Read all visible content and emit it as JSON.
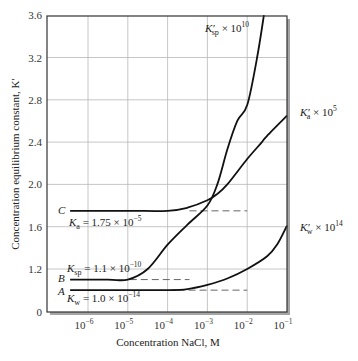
{
  "chart_data": {
    "type": "line",
    "title": "",
    "xlabel": "Concentration NaCl, M",
    "ylabel": "Concentration equilibrium constant, K′",
    "xscale": "log",
    "xlim_log10": [
      -6.5,
      -1
    ],
    "ylim": [
      0,
      3.6
    ],
    "y_axis_break": "axis broken between 0 and 1.2",
    "grid": true,
    "x_ticks": [
      {
        "log": -6,
        "label": "10",
        "exp": "−6"
      },
      {
        "log": -5,
        "label": "10",
        "exp": "−5"
      },
      {
        "log": -4,
        "label": "10",
        "exp": "−4"
      },
      {
        "log": -3,
        "label": "10",
        "exp": "−3"
      },
      {
        "log": -2,
        "label": "10",
        "exp": "−2"
      },
      {
        "log": -1,
        "label": "10",
        "exp": "−1"
      }
    ],
    "y_ticks": [
      "0",
      "1.2",
      "1.6",
      "2.0",
      "2.4",
      "2.8",
      "3.2",
      "3.6"
    ],
    "series": [
      {
        "name": "K′sp × 10^10",
        "letter": "B",
        "thermo_label": "Ksp = 1.1 × 10^−10",
        "x_log10": [
          -6.45,
          -5.5,
          -5.0,
          -4.5,
          -4.0,
          -3.5,
          -3.0,
          -2.75,
          -2.5,
          -2.25,
          -2.0,
          -1.75,
          -1.58
        ],
        "values": [
          1.1,
          1.1,
          1.1,
          1.2,
          1.43,
          1.62,
          1.8,
          2.0,
          2.33,
          2.6,
          2.75,
          3.2,
          3.6
        ],
        "dashed_ref": {
          "value": 1.1,
          "from_log10": -4.95,
          "to_log10": -3.45
        }
      },
      {
        "name": "K′a × 10^5",
        "letter": "C",
        "thermo_label": "Ka = 1.75 × 10^−5",
        "x_log10": [
          -6.45,
          -5.0,
          -4.0,
          -3.5,
          -3.0,
          -2.75,
          -2.5,
          -2.0,
          -1.63,
          -1.5,
          -1.0
        ],
        "values": [
          1.75,
          1.75,
          1.75,
          1.78,
          1.85,
          1.91,
          2.0,
          2.24,
          2.4,
          2.46,
          2.65
        ],
        "dashed_ref": {
          "value": 1.75,
          "from_log10": -3.45,
          "to_log10": -2.0
        }
      },
      {
        "name": "K′w × 10^14",
        "letter": "A",
        "thermo_label": "Kw = 1.0 × 10^−14",
        "x_log10": [
          -6.45,
          -5.0,
          -4.0,
          -3.5,
          -3.0,
          -2.5,
          -2.0,
          -1.5,
          -1.25,
          -1.0
        ],
        "values": [
          1.0,
          1.0,
          1.0,
          1.01,
          1.05,
          1.11,
          1.2,
          1.32,
          1.43,
          1.61
        ],
        "dashed_ref": {
          "value": 1.0,
          "from_log10": -3.75,
          "to_log10": -2.0
        }
      }
    ]
  },
  "labels": {
    "ksp_prime": {
      "k": "K",
      "sub": "sp",
      "prime": "′",
      "times": " × 10",
      "sup": "10"
    },
    "ka_prime": {
      "k": "K",
      "sub": "a",
      "prime": "′",
      "times": " × 10",
      "sup": "5"
    },
    "kw_prime": {
      "k": "K",
      "sub": "w",
      "prime": "′",
      "times": " × 10",
      "sup": "14"
    },
    "letter_c": "C",
    "letter_b": "B",
    "letter_a": "A",
    "ka_const": {
      "k": "K",
      "sub": "a",
      "rest": " = 1.75 × 10",
      "sup": "−5"
    },
    "ksp_const": {
      "k": "K",
      "sub": "sp",
      "rest": " = 1.1 × 10",
      "sup": "−10"
    },
    "kw_const": {
      "k": "K",
      "sub": "w",
      "rest": " = 1.0 × 10",
      "sup": "−14"
    }
  },
  "colors": {
    "curve": "#111111",
    "grid": "#b8b8b8",
    "frame": "#333333",
    "dashed": "#666666",
    "shadow": "#9a9a9a"
  }
}
